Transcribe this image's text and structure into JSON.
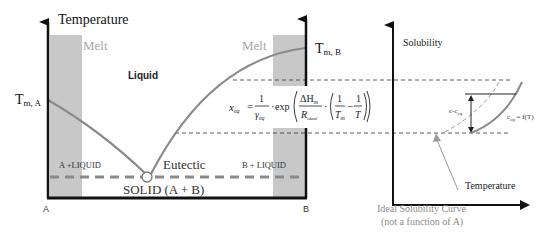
{
  "phase_diagram": {
    "y_axis_label": "Temperature",
    "melt_left": "Melt",
    "melt_right": "Melt",
    "liquid_label": "Liquid",
    "tm_a": {
      "main": "T",
      "sub": "m, A"
    },
    "tm_b": {
      "main": "T",
      "sub": "m, B"
    },
    "a_liquid": "A +LIQUID",
    "b_liquid": "B + LIQUID",
    "eutectic": "Eutectic",
    "solid": "SOLID (A + B)",
    "axis_left_end": "A",
    "axis_right_end": "B"
  },
  "equation": {
    "lhs": "x",
    "lhs_sub": "eq",
    "equals": "=",
    "frac1_num": "1",
    "frac1_den": "γ",
    "frac1_den_sub": "eq",
    "dot": "·",
    "exp": "exp",
    "frac2_num": "ΔH",
    "frac2_num_sub": "m",
    "frac2_den": "R",
    "frac2_den_sub": "ideal",
    "frac3_num": "1",
    "frac3_den": "T",
    "frac3_den_sub": "m",
    "minus": "−",
    "frac4_num": "1",
    "frac4_den": "T"
  },
  "solubility_plot": {
    "y_axis_label": "Solubility",
    "x_axis_label": "Temperature",
    "supersat_label": "c-c",
    "supersat_sub": "eq",
    "curve_label": "c",
    "curve_label_sub": "eq",
    "curve_label_rest": " = f(T)"
  },
  "annotation": {
    "line1": "Ideal Solubility Curve",
    "line2": "(not a function of A)"
  },
  "colors": {
    "band": "#c8c8c8",
    "curve": "#8a8a8a",
    "axis": "#111111",
    "light_text": "#a8a8a8"
  }
}
